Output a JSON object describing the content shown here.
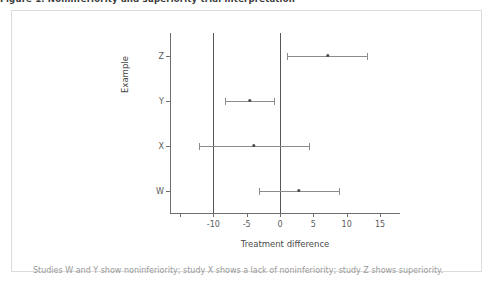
{
  "figure": {
    "title": "Figure 1. Noninferiority and superiority trial interpretation",
    "caption": "Studies W and Y show noninferiority; study X shows a lack of noninferiority; study Z shows superiority."
  },
  "axes": {
    "x_title": "Treatment difference",
    "y_title": "Example",
    "x_ticks": [
      {
        "value": -15,
        "label": ""
      },
      {
        "value": -10,
        "label": "-10"
      },
      {
        "value": -5,
        "label": "-5"
      },
      {
        "value": 0,
        "label": "0"
      },
      {
        "value": 5,
        "label": "5"
      },
      {
        "value": 10,
        "label": "10"
      },
      {
        "value": 15,
        "label": "15"
      }
    ],
    "x_min": -16.5,
    "x_max": 18.0,
    "y_categories": [
      "Z",
      "Y",
      "X",
      "W"
    ]
  },
  "reference_lines": [
    {
      "value": -10,
      "name": "noninferiority-margin",
      "color": "#555555"
    },
    {
      "value": 0,
      "name": "no-difference",
      "color": "#555555"
    }
  ],
  "chart_data": {
    "type": "scatter",
    "title": "",
    "xlabel": "Treatment difference",
    "ylabel": "Example",
    "xlim": [
      -16.5,
      18.0
    ],
    "grid": false,
    "legend": "none",
    "categories": [
      "Z",
      "Y",
      "X",
      "W"
    ],
    "series": [
      {
        "name": "Treatment difference with 95% CI",
        "points": [
          {
            "category": "Z",
            "estimate": 7.2,
            "ci_low": 1.0,
            "ci_high": 13.1,
            "interpretation": "superiority"
          },
          {
            "category": "Y",
            "estimate": -4.5,
            "ci_low": -8.2,
            "ci_high": -0.9,
            "interpretation": "noninferiority"
          },
          {
            "category": "X",
            "estimate": -3.9,
            "ci_low": -12.2,
            "ci_high": 4.3,
            "interpretation": "lack of noninferiority"
          },
          {
            "category": "W",
            "estimate": 2.8,
            "ci_low": -3.1,
            "ci_high": 8.8,
            "interpretation": "noninferiority"
          }
        ]
      }
    ],
    "reference_lines": [
      -10,
      0
    ],
    "annotations": [
      "Studies W and Y show noninferiority; study X shows a lack of noninferiority; study Z shows superiority."
    ]
  }
}
